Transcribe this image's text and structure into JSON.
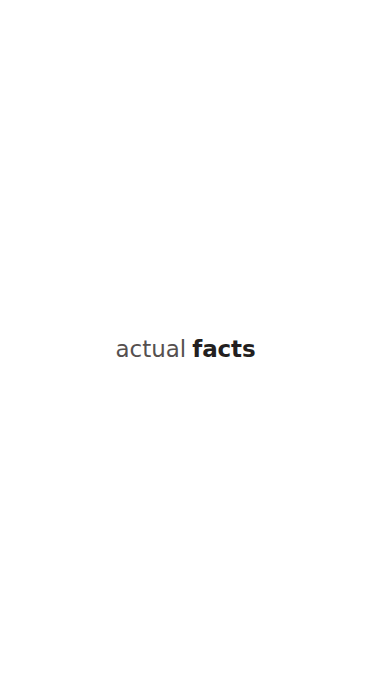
{
  "page": {
    "width": 371,
    "height": 698,
    "background_color": "#ffffff",
    "orientation": "portrait"
  },
  "statement": {
    "full_text": "actual facts",
    "words": [
      {
        "text": "actual",
        "emphasis": "regular",
        "color": "#55504f"
      },
      {
        "text": "facts",
        "emphasis": "bold",
        "color": "#231f20"
      }
    ]
  }
}
